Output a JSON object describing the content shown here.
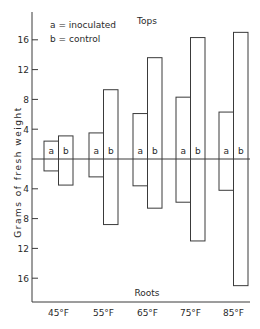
{
  "chart_data": {
    "type": "bar",
    "subtype": "diverging (tops above, roots below zero line)",
    "title": "",
    "top_label": "Tops",
    "bottom_label": "Roots",
    "ylabel": "Grams of fresh weight",
    "xlabel": "",
    "categories": [
      "45°F",
      "55°F",
      "65°F",
      "75°F",
      "85°F"
    ],
    "legend": [
      {
        "key": "a",
        "text": "a = inoculated"
      },
      {
        "key": "b",
        "text": "b = control"
      }
    ],
    "yticks_top": [
      4,
      8,
      12,
      16
    ],
    "yticks_bottom": [
      4,
      8,
      12,
      16
    ],
    "ylim": [
      -17.5,
      17.5
    ],
    "grid": false,
    "series": [
      {
        "name": "inoculated (a)",
        "bar_label": "a",
        "tops": [
          2.4,
          3.5,
          6.1,
          8.3,
          6.3
        ],
        "roots": [
          1.6,
          2.4,
          3.6,
          5.8,
          4.2
        ]
      },
      {
        "name": "control (b)",
        "bar_label": "b",
        "tops": [
          3.1,
          9.3,
          13.6,
          16.3,
          17.0
        ],
        "roots": [
          3.5,
          8.8,
          6.6,
          11.0,
          17.0
        ]
      }
    ]
  }
}
